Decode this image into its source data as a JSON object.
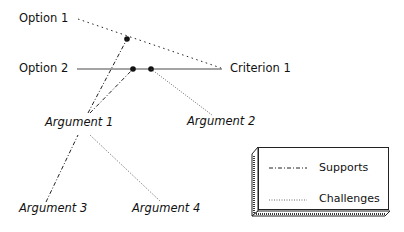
{
  "nodes": {
    "option1": {
      "label": "Option 1"
    },
    "option2": {
      "label": "Option 2"
    },
    "criterion1": {
      "label": "Criterion 1"
    },
    "argument1": {
      "label": "Argument 1"
    },
    "argument2": {
      "label": "Argument 2"
    },
    "argument3": {
      "label": "Argument 3"
    },
    "argument4": {
      "label": "Argument 4"
    }
  },
  "edges": [
    {
      "from": "Option 1",
      "to": "Criterion 1",
      "style": "dotted"
    },
    {
      "from": "Option 2",
      "to": "Criterion 1",
      "style": "solid"
    },
    {
      "from": "Argument 1",
      "to": "Option 1–Criterion 1 link",
      "style": "dash-dot",
      "relation": "Supports"
    },
    {
      "from": "Argument 1",
      "to": "Option 2–Criterion 1 link",
      "style": "dash-dot",
      "relation": "Supports"
    },
    {
      "from": "Argument 2",
      "to": "Option 2–Criterion 1 link",
      "style": "dotted",
      "relation": "Challenges"
    },
    {
      "from": "Argument 3",
      "to": "Argument 1",
      "style": "dash-dot",
      "relation": "Supports"
    },
    {
      "from": "Argument 4",
      "to": "Argument 1",
      "style": "dotted",
      "relation": "Challenges"
    }
  ],
  "legend": {
    "supports": "Supports",
    "challenges": "Challenges"
  }
}
